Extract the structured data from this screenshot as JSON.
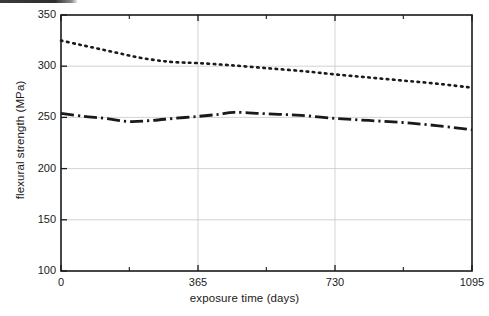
{
  "figure": {
    "background_color": "#ffffff",
    "ink_color": "#1a1a1a",
    "grid_color": "#c8c8c8",
    "scan_artifact_label": "page-edge-scan-band"
  },
  "chart_data": {
    "type": "line",
    "title": "",
    "subtitle": "",
    "xlabel": "exposure time (days)",
    "ylabel": "flexural strength (MPa)",
    "xlim": [
      0,
      1095
    ],
    "ylim": [
      100,
      350
    ],
    "xticks": [
      0,
      365,
      730,
      1095
    ],
    "xtick_labels": [
      "0",
      "365",
      "730",
      "1095"
    ],
    "xminor_ticks": [
      182,
      547,
      912
    ],
    "yticks": [
      100,
      150,
      200,
      250,
      300,
      350
    ],
    "ytick_labels": [
      "100",
      "150",
      "200",
      "250",
      "300",
      "350"
    ],
    "grid": true,
    "grid_axis": "y",
    "legend": null,
    "legend_position": "none",
    "annotations": [],
    "series": [
      {
        "name": "upper curve",
        "style": "dotted",
        "linestyle": "dotted",
        "color": "#1a1a1a",
        "x": [
          0,
          50,
          100,
          150,
          200,
          250,
          300,
          365,
          450,
          550,
          650,
          730,
          820,
          910,
          1000,
          1095
        ],
        "values": [
          325,
          321,
          317,
          313,
          309,
          306,
          304,
          303,
          301,
          298,
          295,
          292,
          289,
          286,
          283,
          279
        ]
      },
      {
        "name": "lower curve",
        "style": "dash-dot",
        "linestyle": "dashdot",
        "color": "#1a1a1a",
        "x": [
          0,
          60,
          120,
          180,
          240,
          300,
          365,
          420,
          460,
          520,
          580,
          640,
          730,
          820,
          910,
          1000,
          1095
        ],
        "values": [
          254,
          251,
          249,
          246,
          247,
          249,
          251,
          253,
          255,
          254,
          253,
          252,
          249,
          247,
          245,
          242,
          238
        ]
      }
    ]
  }
}
